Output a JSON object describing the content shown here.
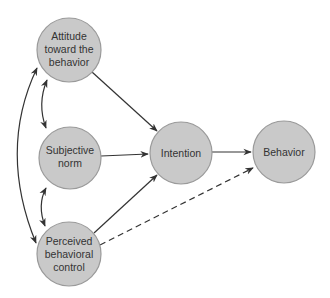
{
  "diagram": {
    "nodes": [
      {
        "id": "attitude",
        "lines": [
          "Attitude",
          "toward the",
          "behavior"
        ],
        "cx": 69,
        "cy": 50,
        "r": 32
      },
      {
        "id": "subjective_norm",
        "lines": [
          "Subjective",
          "norm"
        ],
        "cx": 70,
        "cy": 158,
        "r": 31
      },
      {
        "id": "perceived_control",
        "lines": [
          "Perceived",
          "behavioral",
          "control"
        ],
        "cx": 69,
        "cy": 254,
        "r": 32
      },
      {
        "id": "intention",
        "lines": [
          "Intention"
        ],
        "cx": 181,
        "cy": 153,
        "r": 31
      },
      {
        "id": "behavior",
        "lines": [
          "Behavior"
        ],
        "cx": 284,
        "cy": 152,
        "r": 31
      }
    ],
    "edges": [
      {
        "from": "attitude",
        "to": "intention",
        "style": "solid",
        "direction": "one-way"
      },
      {
        "from": "subjective_norm",
        "to": "intention",
        "style": "solid",
        "direction": "one-way"
      },
      {
        "from": "perceived_control",
        "to": "intention",
        "style": "solid",
        "direction": "one-way"
      },
      {
        "from": "intention",
        "to": "behavior",
        "style": "solid",
        "direction": "one-way"
      },
      {
        "from": "perceived_control",
        "to": "behavior",
        "style": "dashed",
        "direction": "one-way"
      },
      {
        "from": "attitude",
        "to": "subjective_norm",
        "style": "solid",
        "direction": "two-way"
      },
      {
        "from": "subjective_norm",
        "to": "perceived_control",
        "style": "solid",
        "direction": "two-way"
      },
      {
        "from": "attitude",
        "to": "perceived_control",
        "style": "solid",
        "direction": "two-way"
      }
    ],
    "colors": {
      "node_fill": "#c9c9c9",
      "node_stroke": "#9a9a9a",
      "edge": "#333333",
      "text": "#333333"
    }
  }
}
